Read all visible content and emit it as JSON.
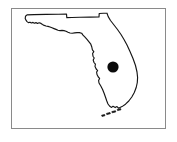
{
  "figure": {
    "kind": "location-map",
    "title": "",
    "caption": "",
    "background_color": "#ffffff"
  },
  "frame": {
    "name": "map-border",
    "stroke_color": "#8a8a8a",
    "fill_color": "#ffffff",
    "x": 11,
    "y": 8,
    "width": 155,
    "height": 121
  },
  "state": {
    "name": "Florida",
    "label": "",
    "outline_color": "#151515",
    "fill_color": "#ffffff",
    "outline_width": 1.15
  },
  "marker": {
    "name": "location-dot",
    "shape": "filled-circle",
    "label": "",
    "color": "#0b0b0b",
    "center_x": 113,
    "center_y": 67,
    "radius": 5.6
  },
  "islands": {
    "name": "florida-keys",
    "label": "",
    "color": "#151515",
    "count": 4
  },
  "chart_data": {
    "type": "map",
    "title": "",
    "xlabel": "",
    "ylabel": "",
    "projection": "none",
    "grid": false,
    "legend": "none",
    "regions": [
      {
        "name": "Florida",
        "outline": true,
        "filled": false
      }
    ],
    "points": [
      {
        "label": "",
        "x": 113,
        "y": 67,
        "marker": "circle",
        "size": 11,
        "color": "#0b0b0b"
      }
    ]
  }
}
